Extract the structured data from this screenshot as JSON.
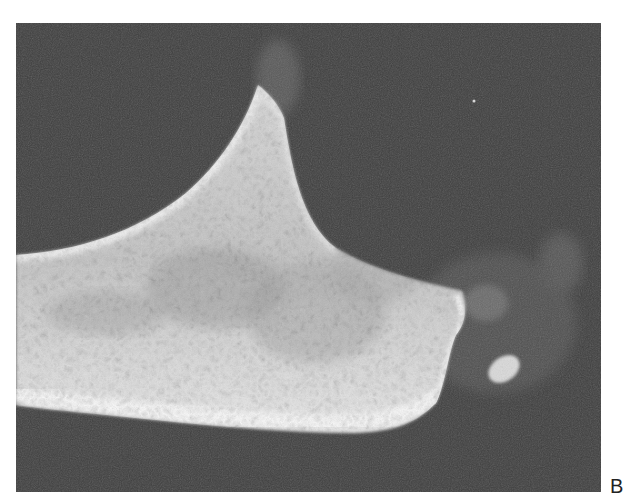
{
  "figure": {
    "panel_label": "B",
    "colors": {
      "background": "#3e3e3e",
      "bone_bright": "#f2f2f2",
      "bone_mid": "#bdbdbd",
      "soft_tissue": "#5a5a5a",
      "page": "#ffffff"
    }
  }
}
